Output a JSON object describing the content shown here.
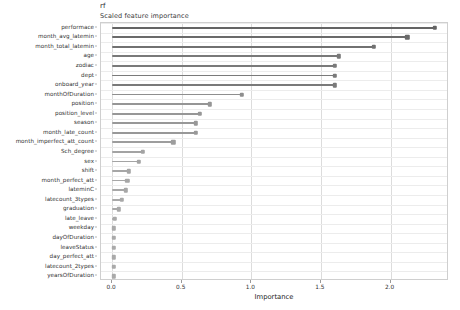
{
  "header": {
    "model_label": "rf",
    "subtitle": "Scaled feature importance"
  },
  "chart_data": {
    "type": "bar",
    "orientation": "horizontal",
    "style": "lollipop",
    "title": "rf",
    "subtitle": "Scaled feature importance",
    "xlabel": "Importance",
    "ylabel": "",
    "xlim": [
      -0.08,
      2.42
    ],
    "xticks": [
      0.0,
      0.5,
      1.0,
      1.5,
      2.0
    ],
    "xtick_labels": [
      "0.0",
      "0.5",
      "1.0",
      "1.5",
      "2.0"
    ],
    "grid": "vertical-major-and-horizontal-minor",
    "legend": "none",
    "bar_color": "#7a7a7a",
    "categories": [
      "performace",
      "month_avg_latemin",
      "month_total_latemin",
      "age",
      "zodiac",
      "dept",
      "onboard_year",
      "monthOfDuration",
      "position",
      "position_level",
      "season",
      "month_late_count",
      "month_imperfect_att_count",
      "Sch_degree",
      "sex",
      "shift",
      "month_perfect_att",
      "lateminC",
      "latecount_3types",
      "graduation",
      "late_leave",
      "weekday",
      "dayOfDuration",
      "leaveStatus",
      "day_perfect_att",
      "latecount_2types",
      "yearsOfDuration"
    ],
    "values": [
      2.32,
      2.12,
      1.88,
      1.63,
      1.6,
      1.6,
      1.6,
      0.93,
      0.7,
      0.63,
      0.6,
      0.6,
      0.44,
      0.22,
      0.19,
      0.12,
      0.11,
      0.1,
      0.07,
      0.05,
      0.02,
      0.01,
      0.01,
      0.01,
      0.01,
      0.01,
      0.01
    ]
  }
}
